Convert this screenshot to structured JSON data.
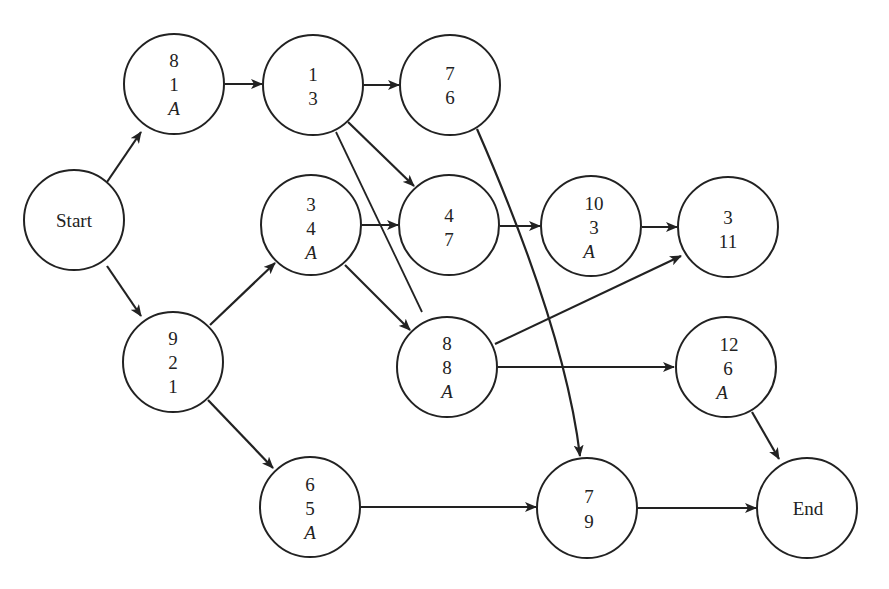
{
  "diagram": {
    "type": "activity-network",
    "nodes": [
      {
        "id": "start",
        "lines": [
          "Start"
        ],
        "x": 74,
        "y": 220
      },
      {
        "id": "n8-1-A",
        "lines": [
          "8",
          "1",
          "A"
        ],
        "x": 174,
        "y": 84
      },
      {
        "id": "n1-3",
        "lines": [
          "1",
          "3"
        ],
        "x": 313,
        "y": 85
      },
      {
        "id": "n7-6",
        "lines": [
          "7",
          "6"
        ],
        "x": 450,
        "y": 85
      },
      {
        "id": "n3-4-A",
        "lines": [
          "3",
          "4",
          "A"
        ],
        "x": 311,
        "y": 225
      },
      {
        "id": "n4-7",
        "lines": [
          "4",
          "7"
        ],
        "x": 449,
        "y": 225
      },
      {
        "id": "n10-3-A",
        "lines": [
          "10",
          "3",
          "A"
        ],
        "x": 591,
        "y": 226
      },
      {
        "id": "n3-11",
        "lines": [
          "3",
          "11"
        ],
        "x": 728,
        "y": 227
      },
      {
        "id": "n9-2-1",
        "lines": [
          "9",
          "2",
          "1"
        ],
        "x": 173,
        "y": 362
      },
      {
        "id": "n8-8-A",
        "lines": [
          "8",
          "8",
          "A"
        ],
        "x": 447,
        "y": 367
      },
      {
        "id": "n12-6-A",
        "lines": [
          "12",
          "6",
          "A"
        ],
        "x": 726,
        "y": 367
      },
      {
        "id": "n6-5-A",
        "lines": [
          "6",
          "5",
          "A"
        ],
        "x": 310,
        "y": 507
      },
      {
        "id": "n7-9",
        "lines": [
          "7",
          "9"
        ],
        "x": 587,
        "y": 508
      },
      {
        "id": "end",
        "lines": [
          "End"
        ],
        "x": 807,
        "y": 508
      }
    ],
    "edges": [
      {
        "from": "start",
        "to": "n8-1-A"
      },
      {
        "from": "start",
        "to": "n9-2-1"
      },
      {
        "from": "n8-1-A",
        "to": "n1-3"
      },
      {
        "from": "n1-3",
        "to": "n7-6"
      },
      {
        "from": "n1-3",
        "to": "n4-7"
      },
      {
        "from": "n1-3",
        "to": "n8-8-A",
        "arrow": false
      },
      {
        "from": "n9-2-1",
        "to": "n3-4-A"
      },
      {
        "from": "n9-2-1",
        "to": "n6-5-A"
      },
      {
        "from": "n3-4-A",
        "to": "n4-7"
      },
      {
        "from": "n3-4-A",
        "to": "n8-8-A"
      },
      {
        "from": "n4-7",
        "to": "n10-3-A"
      },
      {
        "from": "n10-3-A",
        "to": "n3-11"
      },
      {
        "from": "n7-6",
        "to": "n7-9",
        "curved": true
      },
      {
        "from": "n8-8-A",
        "to": "n3-11"
      },
      {
        "from": "n8-8-A",
        "to": "n12-6-A"
      },
      {
        "from": "n12-6-A",
        "to": "end"
      },
      {
        "from": "n6-5-A",
        "to": "n7-9"
      },
      {
        "from": "n7-9",
        "to": "end"
      }
    ]
  },
  "labels": {
    "start": "Start",
    "end": "End",
    "n8_1_A": [
      "8",
      "1",
      "A"
    ],
    "n1_3": [
      "1",
      "3"
    ],
    "n7_6": [
      "7",
      "6"
    ],
    "n3_4_A": [
      "3",
      "4",
      "A"
    ],
    "n4_7": [
      "4",
      "7"
    ],
    "n10_3_A": [
      "10",
      "3",
      "A"
    ],
    "n3_11": [
      "3",
      "11"
    ],
    "n9_2_1": [
      "9",
      "2",
      "1"
    ],
    "n8_8_A": [
      "8",
      "8",
      "A"
    ],
    "n12_6_A": [
      "12",
      "6",
      "A"
    ],
    "n6_5_A": [
      "6",
      "5",
      "A"
    ],
    "n7_9": [
      "7",
      "9"
    ]
  },
  "colors": {
    "ink": "#222222",
    "background": "#ffffff"
  }
}
